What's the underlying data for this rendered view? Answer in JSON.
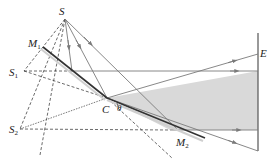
{
  "diagram": {
    "labels": {
      "source": "S",
      "image1": "S",
      "image1_sub": "1",
      "image2": "S",
      "image2_sub": "2",
      "mirror1": "M",
      "mirror1_sub": "1",
      "mirror2": "M",
      "mirror2_sub": "2",
      "junction": "C",
      "angle": "θ",
      "screen": "E"
    },
    "colors": {
      "line": "#7a7a7a",
      "mirror": "#333333",
      "shade": "#d9d9d9",
      "text": "#222222"
    }
  }
}
